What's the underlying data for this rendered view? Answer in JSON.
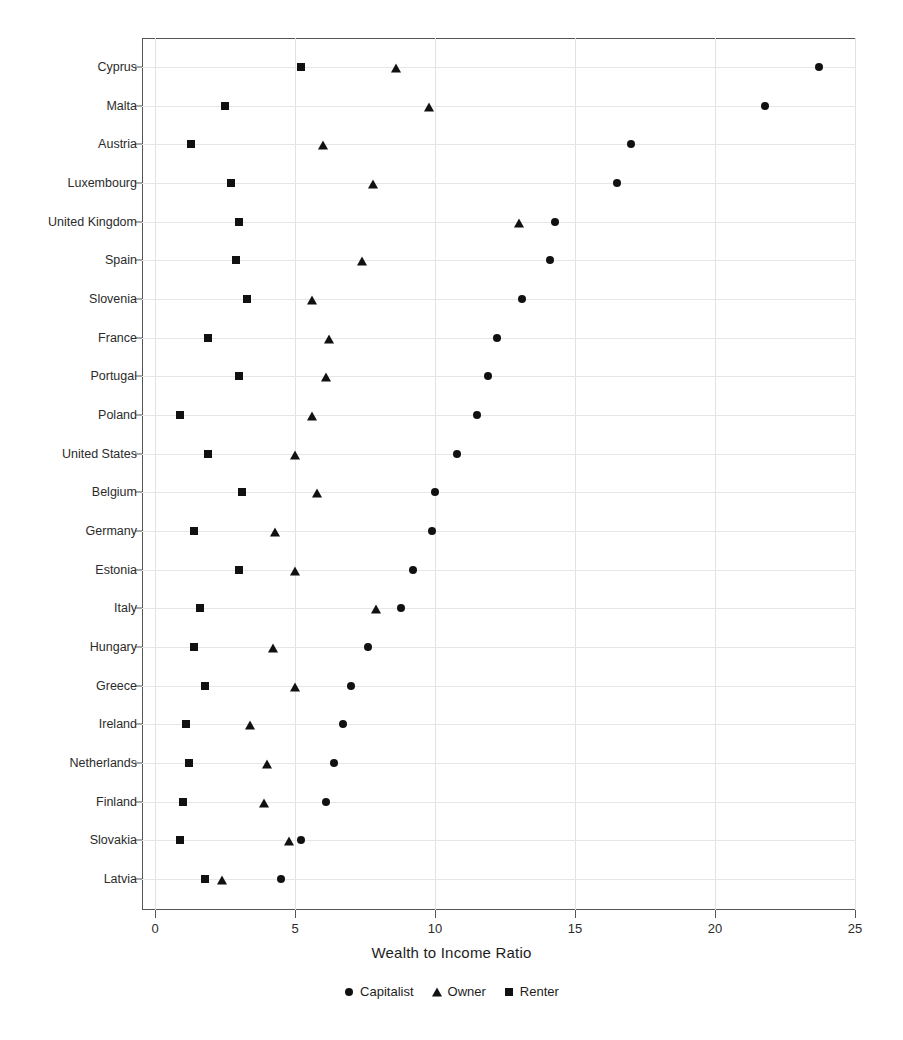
{
  "chart_data": {
    "type": "scatter",
    "title": "",
    "subtitle": "",
    "xlabel": "Wealth to Income Ratio",
    "ylabel": "",
    "xlim": [
      0,
      25
    ],
    "xticks": [
      0,
      5,
      10,
      15,
      20,
      25
    ],
    "xtick_labels": [
      "0",
      "5",
      "10",
      "15",
      "20",
      "25"
    ],
    "grid": true,
    "legend_position": "bottom-center",
    "orientation": "horizontal",
    "categories": [
      "Cyprus",
      "Malta",
      "Austria",
      "Luxembourg",
      "United Kingdom",
      "Spain",
      "Slovenia",
      "France",
      "Portugal",
      "Poland",
      "United States",
      "Belgium",
      "Germany",
      "Estonia",
      "Italy",
      "Hungary",
      "Greece",
      "Ireland",
      "Netherlands",
      "Finland",
      "Slovakia",
      "Latvia"
    ],
    "series": [
      {
        "name": "Capitalist",
        "marker": "circle",
        "color": "#111111",
        "values": [
          23.7,
          21.8,
          17.0,
          16.5,
          14.3,
          14.1,
          13.1,
          12.2,
          11.9,
          11.5,
          10.8,
          10.0,
          9.9,
          9.2,
          8.8,
          7.6,
          7.0,
          6.7,
          6.4,
          6.1,
          5.2,
          4.5
        ]
      },
      {
        "name": "Owner",
        "marker": "triangle",
        "color": "#111111",
        "values": [
          8.6,
          9.8,
          6.0,
          7.8,
          13.0,
          7.4,
          5.6,
          6.2,
          6.1,
          5.6,
          5.0,
          5.8,
          4.3,
          5.0,
          7.9,
          4.2,
          5.0,
          3.4,
          4.0,
          3.9,
          4.8,
          2.4
        ]
      },
      {
        "name": "Renter",
        "marker": "square",
        "color": "#111111",
        "values": [
          5.2,
          2.5,
          1.3,
          2.7,
          3.0,
          2.9,
          3.3,
          1.9,
          3.0,
          0.9,
          1.9,
          3.1,
          1.4,
          3.0,
          1.6,
          1.4,
          1.8,
          1.1,
          1.2,
          1.0,
          0.9,
          1.8
        ]
      }
    ]
  },
  "axis": {
    "x_title": "Wealth to Income Ratio"
  },
  "legend": {
    "entries": [
      {
        "label": "Capitalist",
        "marker": "circle"
      },
      {
        "label": "Owner",
        "marker": "triangle"
      },
      {
        "label": "Renter",
        "marker": "square"
      }
    ]
  }
}
